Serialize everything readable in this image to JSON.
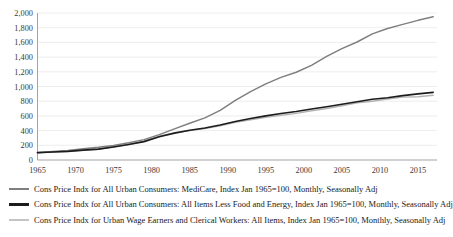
{
  "chart_data": {
    "type": "line",
    "title": "",
    "xlabel": "",
    "ylabel": "",
    "xlim": [
      1965,
      2017.5
    ],
    "ylim": [
      0,
      2000
    ],
    "grid": true,
    "legend_position": "bottom",
    "x_ticks": [
      "1965",
      "1970",
      "1975",
      "1980",
      "1985",
      "1990",
      "1995",
      "2000",
      "2005",
      "2010",
      "2015"
    ],
    "y_ticks": [
      "0",
      "200",
      "400",
      "600",
      "800",
      "1,000",
      "1,200",
      "1,400",
      "1,600",
      "1,800",
      "2,000"
    ],
    "x": [
      1965,
      1967,
      1969,
      1971,
      1973,
      1975,
      1977,
      1979,
      1981,
      1983,
      1985,
      1987,
      1989,
      1991,
      1993,
      1995,
      1997,
      1999,
      2001,
      2003,
      2005,
      2007,
      2009,
      2011,
      2013,
      2015,
      2017
    ],
    "series": [
      {
        "name": "Cons Price Indx for All Urban Consumers: MediCare, Index Jan 1965=100, Monthly, Seasonally Adj",
        "color": "#7f7f7f",
        "width": 1.5,
        "values": [
          100,
          114,
          130,
          152,
          172,
          197,
          234,
          277,
          345,
          424,
          500,
          573,
          676,
          810,
          930,
          1035,
          1124,
          1194,
          1288,
          1410,
          1516,
          1605,
          1716,
          1790,
          1845,
          1900,
          1950
        ]
      },
      {
        "name": "Cons Price Indx for All Urban Consumers: All Items Less Food and Energy, Index Jan 1965=100, Monthly, Seasonally Adj",
        "color": "#1c1c1c",
        "width": 1.6,
        "values": [
          100,
          108,
          118,
          134,
          148,
          178,
          212,
          250,
          316,
          366,
          404,
          436,
          476,
          524,
          564,
          600,
          632,
          660,
          694,
          724,
          758,
          792,
          826,
          846,
          876,
          900,
          920
        ]
      },
      {
        "name": "Cons Price Indx for Urban Wage Earners and Clerical Workers: All Items, Index Jan 1965=100, Monthly, Seasonally Adj",
        "color": "#b3b3b3",
        "width": 1.4,
        "values": [
          100,
          107,
          117,
          133,
          147,
          180,
          214,
          256,
          326,
          370,
          400,
          428,
          466,
          514,
          548,
          580,
          608,
          634,
          670,
          700,
          738,
          778,
          800,
          830,
          856,
          860,
          880
        ]
      }
    ]
  },
  "legend": {
    "items": [
      {
        "label": "Cons Price Indx for All Urban Consumers: MediCare, Index Jan 1965=100, Monthly, Seasonally Adj",
        "swatch_color": "#7f7f7f",
        "swatch_thickness": "2px"
      },
      {
        "label": "Cons Price Indx for All Urban Consumers: All Items Less Food and Energy, Index Jan 1965=100, Monthly, Seasonally Adj",
        "swatch_color": "#1c1c1c",
        "swatch_thickness": "2.6px"
      },
      {
        "label": "Cons Price Indx for Urban Wage Earners and Clerical Workers: All Items, Index Jan 1965=100, Monthly, Seasonally Adj",
        "swatch_color": "#c4c4c4",
        "swatch_thickness": "1.6px"
      }
    ]
  },
  "colors": {
    "gridline": "#e8e8e8",
    "axis": "#9a9a9a",
    "tick_text": "#3a3a3a",
    "background": "#ffffff"
  }
}
